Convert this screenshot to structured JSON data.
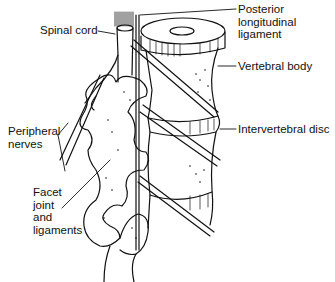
{
  "diagram": {
    "type": "anatomical line drawing",
    "labels": {
      "spinal_cord": "Spinal cord",
      "posterior_longitudinal_ligament": "Posterior\nlongitudinal\nligament",
      "vertebral_body": "Vertebral body",
      "intervertebral_disc": "Intervertebral disc",
      "peripheral_nerves": "Peripheral\nnerves",
      "facet_joint": "Facet\njoint\nand\nligaments"
    },
    "colors": {
      "ink": "#111111",
      "background": "#ffffff"
    }
  }
}
